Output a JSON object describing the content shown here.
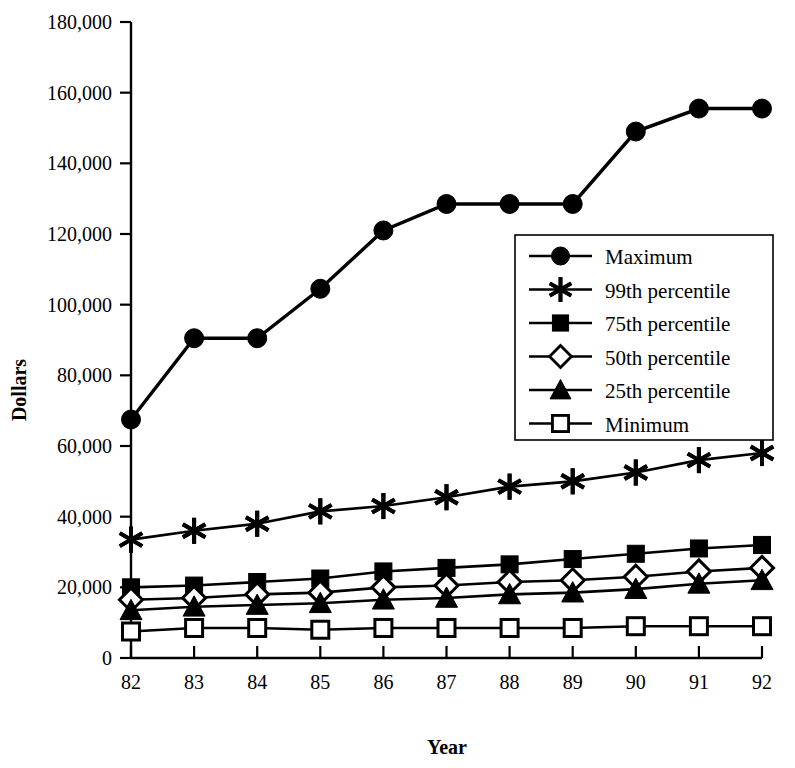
{
  "chart_data": {
    "type": "line",
    "title": "",
    "xlabel": "Year",
    "ylabel": "Dollars",
    "categories": [
      "82",
      "83",
      "84",
      "85",
      "86",
      "87",
      "88",
      "89",
      "90",
      "91",
      "92"
    ],
    "x": [
      82,
      83,
      84,
      85,
      86,
      87,
      88,
      89,
      90,
      91,
      92
    ],
    "xlim": [
      82,
      92
    ],
    "ylim": [
      0,
      180000
    ],
    "ytick_values": [
      0,
      20000,
      40000,
      60000,
      80000,
      100000,
      120000,
      140000,
      160000,
      180000
    ],
    "ytick_labels": [
      "0",
      "20,000",
      "40,000",
      "60,000",
      "80,000",
      "100,000",
      "120,000",
      "140,000",
      "160,000",
      "180,000"
    ],
    "grid": false,
    "legend_position": "center-right",
    "series": [
      {
        "name": "Maximum",
        "marker": "filled-circle",
        "values": [
          67500,
          90500,
          90500,
          104500,
          121000,
          128500,
          128500,
          128500,
          149000,
          155500,
          155500
        ]
      },
      {
        "name": "99th percentile",
        "marker": "asterisk",
        "values": [
          33500,
          36000,
          38000,
          41500,
          43000,
          45500,
          48500,
          50000,
          52500,
          56000,
          58000
        ]
      },
      {
        "name": "75th percentile",
        "marker": "filled-square",
        "values": [
          20000,
          20500,
          21500,
          22500,
          24500,
          25500,
          26500,
          28000,
          29500,
          31000,
          32000
        ]
      },
      {
        "name": "50th percentile",
        "marker": "open-diamond",
        "values": [
          16500,
          17000,
          18000,
          18500,
          20000,
          20500,
          21500,
          22000,
          23000,
          24500,
          25500
        ]
      },
      {
        "name": "25th percentile",
        "marker": "filled-triangle",
        "values": [
          13500,
          14500,
          15000,
          15500,
          16500,
          17000,
          18000,
          18500,
          19500,
          21000,
          22000
        ]
      },
      {
        "name": "Minimum",
        "marker": "open-square",
        "values": [
          7500,
          8500,
          8500,
          8000,
          8500,
          8500,
          8500,
          8500,
          9000,
          9000,
          9000
        ]
      }
    ]
  },
  "legend": {
    "items": [
      {
        "label": "Maximum",
        "marker": "filled-circle"
      },
      {
        "label": "99th percentile",
        "marker": "asterisk"
      },
      {
        "label": "75th percentile",
        "marker": "filled-square"
      },
      {
        "label": "50th percentile",
        "marker": "open-diamond"
      },
      {
        "label": "25th percentile",
        "marker": "filled-triangle"
      },
      {
        "label": "Minimum",
        "marker": "open-square"
      }
    ]
  },
  "colors": {
    "ink": "#000000",
    "background": "#ffffff"
  }
}
